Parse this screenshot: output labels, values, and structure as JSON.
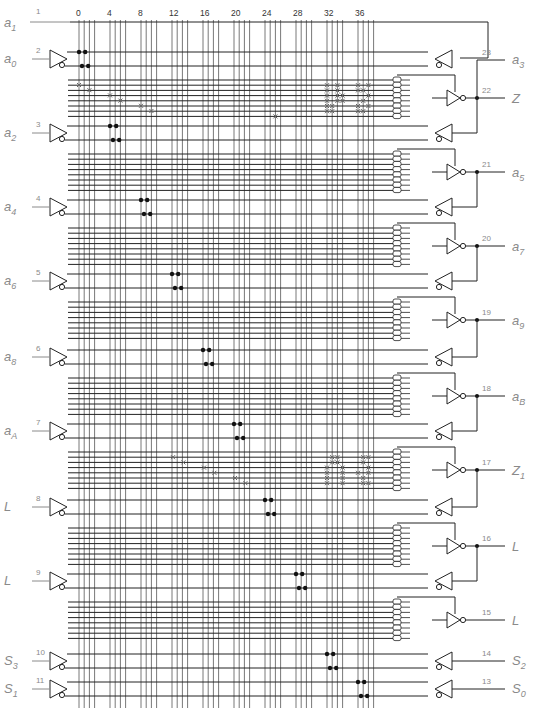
{
  "colors": {
    "line": "#222222",
    "vline": "#555555",
    "label": "#8a8a8a",
    "fuse": "#666666",
    "dot": "#111111"
  },
  "column_numbers": [
    "0",
    "4",
    "8",
    "12",
    "16",
    "20",
    "24",
    "28",
    "32",
    "36"
  ],
  "top_feedback": {
    "pin": "1",
    "label": "a",
    "sub": "1"
  },
  "inputs": [
    {
      "pin": "2",
      "label": "a",
      "sub": "0"
    },
    {
      "pin": "3",
      "label": "a",
      "sub": "2"
    },
    {
      "pin": "4",
      "label": "a",
      "sub": "4"
    },
    {
      "pin": "5",
      "label": "a",
      "sub": "6"
    },
    {
      "pin": "6",
      "label": "a",
      "sub": "8"
    },
    {
      "pin": "7",
      "label": "a",
      "sub": "A"
    },
    {
      "pin": "8",
      "label": "L",
      "sub": ""
    },
    {
      "pin": "9",
      "label": "L",
      "sub": ""
    },
    {
      "pin": "10",
      "label": "S",
      "sub": "3"
    },
    {
      "pin": "11",
      "label": "S",
      "sub": "1"
    }
  ],
  "outputs": [
    {
      "pin": "23",
      "label": "a",
      "sub": "3"
    },
    {
      "pin": "22",
      "label": "Z",
      "sub": ""
    },
    {
      "pin": "21",
      "label": "a",
      "sub": "5"
    },
    {
      "pin": "20",
      "label": "a",
      "sub": "7"
    },
    {
      "pin": "19",
      "label": "a",
      "sub": "9"
    },
    {
      "pin": "18",
      "label": "a",
      "sub": "B"
    },
    {
      "pin": "17",
      "label": "Z",
      "sub": "1"
    },
    {
      "pin": "16",
      "label": "L",
      "sub": ""
    },
    {
      "pin": "15",
      "label": "L",
      "sub": ""
    },
    {
      "pin": "14",
      "label": "S",
      "sub": "2"
    },
    {
      "pin": "13",
      "label": "S",
      "sub": "0"
    }
  ],
  "product_term_groups": 8,
  "fuse_marks": {
    "group_1": "diagonal 0-9 columns plus cluster at columns 32-38, single mark at col 26",
    "group_6": "diagonal 12-21 columns plus cluster at columns 32-38"
  }
}
